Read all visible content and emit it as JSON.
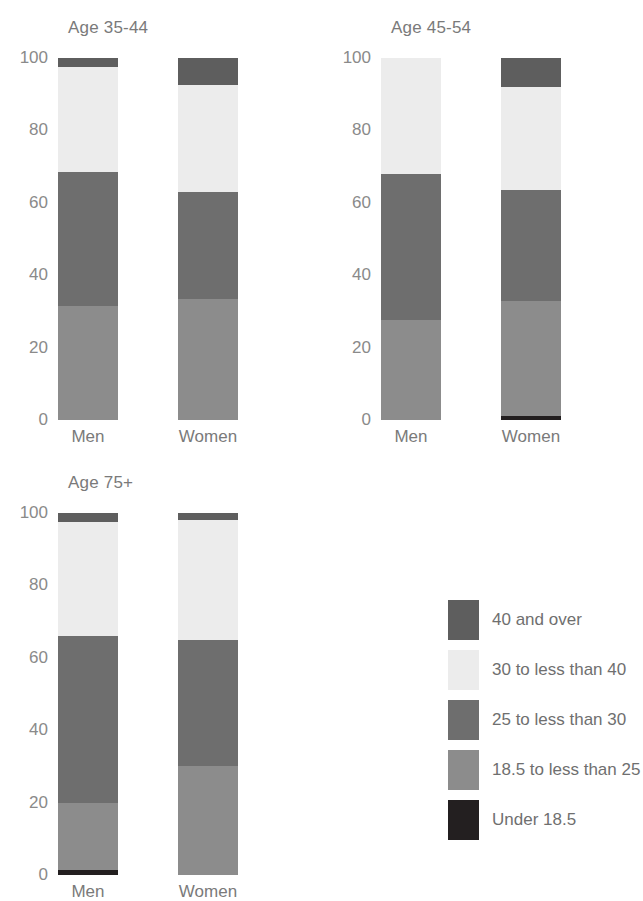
{
  "chart_data": {
    "type": "bar",
    "subtype": "stacked-bar-100-percent",
    "title": "",
    "xlabel": "",
    "ylabel": "",
    "ylim": [
      0,
      100
    ],
    "yticks": [
      0,
      20,
      40,
      60,
      80,
      100
    ],
    "ytick_labels": [
      "0",
      "20",
      "40",
      "60",
      "80",
      "100"
    ],
    "grid": false,
    "legend_position": "bottom-right",
    "categories": [
      "Men",
      "Women"
    ],
    "series": [
      {
        "name": "Under 18.5",
        "color": "#231f20"
      },
      {
        "name": "18.5 to less than 25",
        "color": "#8c8c8c"
      },
      {
        "name": "25 to less than 30",
        "color": "#6e6e6e"
      },
      {
        "name": "30 to less than 40",
        "color": "#ececec"
      },
      {
        "name": "40 and over",
        "color": "#5e5e5e"
      }
    ],
    "panels": [
      {
        "title": "Age 35-44",
        "bars": [
          {
            "category": "Men",
            "values": {
              "Under 18.5": 0.0,
              "18.5 to less than 25": 31.5,
              "25 to less than 30": 37.0,
              "30 to less than 40": 29.0,
              "40 and over": 2.5
            }
          },
          {
            "category": "Women",
            "values": {
              "Under 18.5": 0.0,
              "18.5 to less than 25": 33.5,
              "25 to less than 30": 29.5,
              "30 to less than 40": 29.5,
              "40 and over": 7.5
            }
          }
        ]
      },
      {
        "title": "Age 45-54",
        "bars": [
          {
            "category": "Men",
            "values": {
              "Under 18.5": 0.0,
              "18.5 to less than 25": 27.5,
              "25 to less than 30": 40.5,
              "30 to less than 40": 32.0,
              "40 and over": 0.0
            }
          },
          {
            "category": "Women",
            "values": {
              "Under 18.5": 1.0,
              "18.5 to less than 25": 32.0,
              "25 to less than 30": 30.5,
              "30 to less than 40": 28.5,
              "40 and over": 8.0
            }
          }
        ]
      },
      {
        "title": "Age 75+",
        "bars": [
          {
            "category": "Men",
            "values": {
              "Under 18.5": 1.5,
              "18.5 to less than 25": 18.5,
              "25 to less than 30": 46.0,
              "30 to less than 40": 31.5,
              "40 and over": 2.5
            }
          },
          {
            "category": "Women",
            "values": {
              "Under 18.5": 0.0,
              "18.5 to less than 25": 30.0,
              "25 to less than 30": 35.0,
              "30 to less than 40": 33.0,
              "40 and over": 2.0
            }
          }
        ]
      }
    ]
  },
  "legend": {
    "items": [
      {
        "label": "40 and over",
        "color": "#5e5e5e"
      },
      {
        "label": "30 to less than 40",
        "color": "#ececec"
      },
      {
        "label": "25 to less than 30",
        "color": "#6e6e6e"
      },
      {
        "label": "18.5 to less than 25",
        "color": "#8c8c8c"
      },
      {
        "label": "Under 18.5",
        "color": "#231f20"
      }
    ]
  }
}
